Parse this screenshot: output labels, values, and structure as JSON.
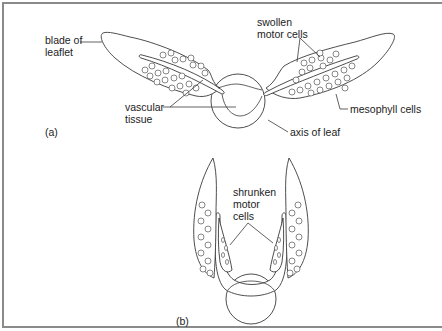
{
  "figure": {
    "panel_a": {
      "tag": "(a)",
      "labels": {
        "blade_line1": "blade of",
        "blade_line2": "leaflet",
        "swollen_line1": "swollen",
        "swollen_line2": "motor cells",
        "vascular_line1": "vascular",
        "vascular_line2": "tissue",
        "mesophyll": "mesophyll cells",
        "axis": "axis of leaf"
      }
    },
    "panel_b": {
      "tag": "(b)",
      "labels": {
        "shrunken_line1": "shrunken",
        "shrunken_line2": "motor",
        "shrunken_line3": "cells"
      }
    }
  }
}
